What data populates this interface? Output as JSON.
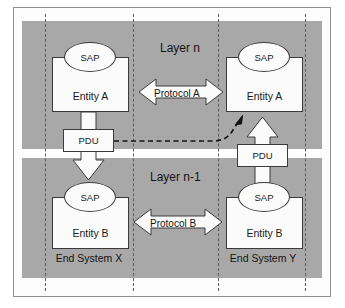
{
  "figure": {
    "type": "layered-protocol-architecture-diagram",
    "background_color": "#ffffff",
    "panel_color": "#a8a8a8",
    "box_fill": "#fbfbfb",
    "line_color": "#3a3a3a",
    "dashed_line_color": "#5d5d5d"
  },
  "layers": {
    "upper": {
      "caption": "Layer n"
    },
    "lower": {
      "caption": "Layer n-1"
    }
  },
  "systems": {
    "left": {
      "caption": "End System X"
    },
    "right": {
      "caption": "End System Y"
    }
  },
  "entities": {
    "upper_left": {
      "label": "Entity A",
      "sap": "SAP"
    },
    "upper_right": {
      "label": "Entity A",
      "sap": "SAP"
    },
    "lower_left": {
      "label": "Entity B",
      "sap": "SAP"
    },
    "lower_right": {
      "label": "Entity B",
      "sap": "SAP"
    }
  },
  "protocols": {
    "upper": {
      "label": "Protocol A"
    },
    "lower": {
      "label": "Protocol B"
    }
  },
  "pdus": {
    "left": {
      "label": "PDU",
      "direction": "down"
    },
    "right": {
      "label": "PDU",
      "direction": "up"
    }
  },
  "connectors": {
    "logical_peer_transfer": {
      "style": "dashed",
      "from": "left-pdu",
      "to": "upper-right-entity"
    }
  }
}
